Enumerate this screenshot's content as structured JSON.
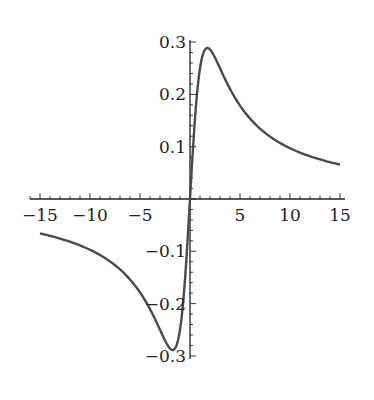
{
  "chart_data": {
    "type": "line",
    "title": "",
    "xlabel": "",
    "ylabel": "",
    "xlim": [
      -15,
      15
    ],
    "ylim": [
      -0.3,
      0.3
    ],
    "grid": false,
    "legend": null,
    "x_ticks": [
      -15,
      -10,
      -5,
      5,
      10,
      15
    ],
    "x_tick_labels": [
      "−15",
      "−10",
      "−5",
      "5",
      "10",
      "15"
    ],
    "y_ticks": [
      0.3,
      0.2,
      0.1,
      -0.1,
      -0.2,
      -0.3
    ],
    "y_tick_labels": [
      "0.3",
      "0.2",
      "0.1",
      "−0.1",
      "−0.2",
      "−0.3"
    ],
    "series": [
      {
        "name": "f(x)",
        "description": "odd function approximately x/(x^2+3), max ~0.29 near x~1.7, min ~-0.29 near x~-1.7",
        "x": [
          -15,
          -12,
          -10,
          -8,
          -6,
          -5,
          -4,
          -3,
          -2,
          -1.7,
          -1,
          -0.5,
          0,
          0.5,
          1,
          1.7,
          2,
          3,
          4,
          5,
          6,
          8,
          10,
          12,
          15
        ],
        "y": [
          -0.066,
          -0.082,
          -0.097,
          -0.119,
          -0.154,
          -0.179,
          -0.211,
          -0.25,
          -0.286,
          -0.289,
          -0.25,
          -0.154,
          0,
          0.154,
          0.25,
          0.289,
          0.286,
          0.25,
          0.211,
          0.179,
          0.154,
          0.119,
          0.097,
          0.082,
          0.066
        ]
      }
    ],
    "colors": {
      "curve": "#4a4a4a",
      "axis": "#222222"
    }
  }
}
